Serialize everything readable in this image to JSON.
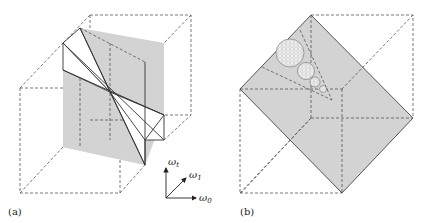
{
  "panels": [
    {
      "id": "a",
      "label": "(a)"
    },
    {
      "id": "b",
      "label": "(b)"
    }
  ],
  "axes": {
    "t": {
      "symbol": "ω",
      "subscript": "t"
    },
    "one": {
      "symbol": "ω",
      "subscript": "1"
    },
    "zero": {
      "symbol": "ω",
      "subscript": "0"
    }
  },
  "colors": {
    "plane_fill": "#d3d3d3",
    "line": "#333333",
    "dashed": "#555555"
  }
}
